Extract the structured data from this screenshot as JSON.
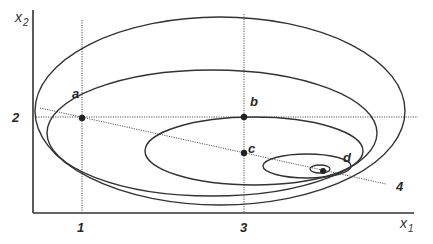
{
  "axes": {
    "x_label": "x",
    "x_sub": "1",
    "y_label": "x",
    "y_sub": "2",
    "x_ticks": [
      "1",
      "3"
    ],
    "y_ticks": [
      "2"
    ]
  },
  "points": {
    "a": "a",
    "b": "b",
    "c": "c",
    "d": "d"
  },
  "line_label": "4",
  "colors": {
    "stroke": "#333333",
    "dotted": "#555555"
  }
}
